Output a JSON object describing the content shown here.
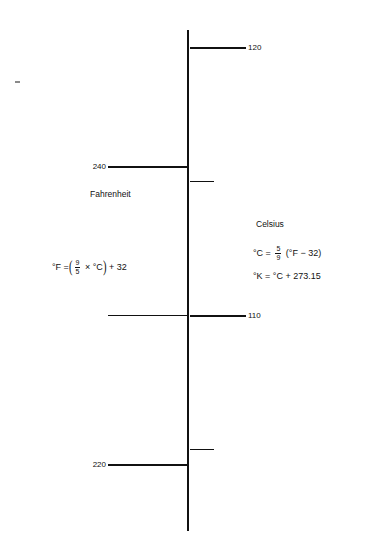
{
  "diagram": {
    "scales": {
      "fahrenheit": {
        "name": "Fahrenheit",
        "unit": "°F",
        "side": "left",
        "major_labels": [
          240,
          220,
          200,
          180,
          160,
          140,
          120,
          100,
          80,
          60,
          40,
          20,
          0,
          -20,
          -40,
          -60
        ],
        "minor_ticks": [
          250,
          230,
          210,
          190,
          170,
          150,
          130,
          110,
          90,
          70,
          50,
          30,
          10,
          -10,
          -30,
          -50
        ],
        "axis_min": -68,
        "axis_max": 252
      },
      "celsius": {
        "name": "Celsius",
        "unit": "°C",
        "side": "right",
        "major_labels": [
          120,
          110,
          100,
          90,
          80,
          70,
          60,
          50,
          40,
          30,
          20,
          10,
          0,
          -10,
          -20,
          -30,
          -40,
          -50,
          -60
        ],
        "minor_ticks": [
          115,
          105,
          95,
          85,
          75,
          65,
          55,
          45,
          35,
          25,
          15,
          5,
          -5,
          -15,
          -25,
          -35,
          -45,
          -55
        ],
        "axis_min": -60,
        "axis_max": 122
      }
    },
    "reference_lines": [
      {
        "id": "water-boils",
        "label": "Water boils",
        "label_line_1": "Water",
        "label_line_2": "boils",
        "fahrenheit_label": "212°F",
        "celsius_label": "100°C",
        "celsius_value": 100
      },
      {
        "id": "water-freezes",
        "label": "Water freezes",
        "label_line_1": "Water",
        "label_line_2": "freezes",
        "fahrenheit_label": "32°F",
        "celsius_label": "0°C",
        "celsius_value": 0
      }
    ],
    "formulas": {
      "fahrenheit_conversion": {
        "lhs": "°F =",
        "open_paren": "(",
        "numerator": "9",
        "denominator": "5",
        "middle": "× °C",
        "close_paren": ")",
        "tail": "+ 32",
        "plain": "°F = (9/5 × °C) + 32"
      },
      "celsius_conversion": {
        "lhs": "°C =",
        "numerator": "5",
        "denominator": "9",
        "tail": "(°F − 32)",
        "plain": "°C = 5/9 (°F − 32)"
      },
      "kelvin_conversion": {
        "plain": "°K = °C + 273.15"
      }
    },
    "colors": {
      "ink": "#111111",
      "background": "#ffffff"
    }
  }
}
